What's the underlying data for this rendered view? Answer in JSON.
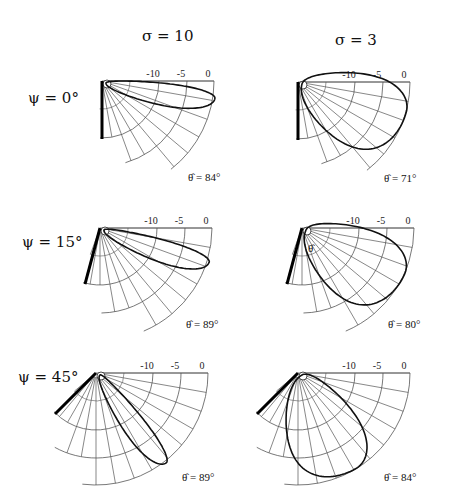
{
  "columns": [
    {
      "label": "σ = 10",
      "sigma": 10
    },
    {
      "label": "σ = 3",
      "sigma": 3
    }
  ],
  "rows": [
    {
      "label": "ψ = 0°",
      "psi": 0
    },
    {
      "label": "ψ = 15°",
      "psi": 15
    },
    {
      "label": "ψ = 45°",
      "psi": 45
    }
  ],
  "tick_labels": [
    "-10",
    "-5",
    "0"
  ],
  "panels": [
    {
      "id": "psi0-sigma10",
      "psi": 0,
      "sigma": 10,
      "theta_hat_label": "θ̂ = 84°",
      "theta_hat": 84
    },
    {
      "id": "psi0-sigma3",
      "psi": 0,
      "sigma": 3,
      "theta_hat_label": "θ̂ = 71°",
      "theta_hat": 71
    },
    {
      "id": "psi15-sigma10",
      "psi": 15,
      "sigma": 10,
      "theta_hat_label": "θ̂ = 89°",
      "theta_hat": 89
    },
    {
      "id": "psi15-sigma3",
      "psi": 15,
      "sigma": 3,
      "theta_hat_label": "θ̂ = 80°",
      "theta_hat": 80,
      "inner_label": "θ̂"
    },
    {
      "id": "psi45-sigma10",
      "psi": 45,
      "sigma": 10,
      "theta_hat_label": "θ̂ = 89°",
      "theta_hat": 89
    },
    {
      "id": "psi45-sigma3",
      "psi": 45,
      "sigma": 3,
      "theta_hat_label": "θ̂ = 84°",
      "theta_hat": 84
    }
  ],
  "colors": {
    "grid": "#555555",
    "lobe": "#111111",
    "wall": "#000000"
  }
}
